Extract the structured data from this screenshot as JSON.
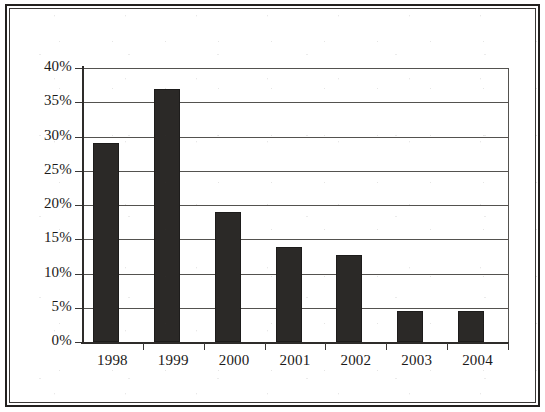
{
  "chart_data": {
    "type": "bar",
    "title": "",
    "subtitle": "",
    "xlabel": "",
    "ylabel": "",
    "categories": [
      "1998",
      "1999",
      "2000",
      "2001",
      "2002",
      "2003",
      "2004"
    ],
    "values": [
      29,
      37,
      19,
      13.8,
      12.7,
      4.6,
      4.6
    ],
    "value_format": "percent",
    "ylim": [
      0,
      40
    ],
    "ytick_values": [
      0,
      5,
      10,
      15,
      20,
      25,
      30,
      35,
      40
    ],
    "ytick_labels": [
      "0%",
      "5%",
      "10%",
      "15%",
      "20%",
      "25%",
      "30%",
      "35%",
      "40%"
    ],
    "grid": true,
    "grid_axis": "y",
    "legend": false,
    "legend_position": "none",
    "series": [
      {
        "name": "",
        "values": [
          29,
          37,
          19,
          13.8,
          12.7,
          4.6,
          4.6
        ],
        "color": "#2b2927"
      }
    ],
    "annotations": []
  },
  "style": {
    "bar_color": "#2b2927",
    "grid_color": "#54524f",
    "axis_color": "#2e2c2a",
    "text_color": "#1b1a19",
    "background": "#ffffff",
    "frame_color": "#23211f"
  }
}
